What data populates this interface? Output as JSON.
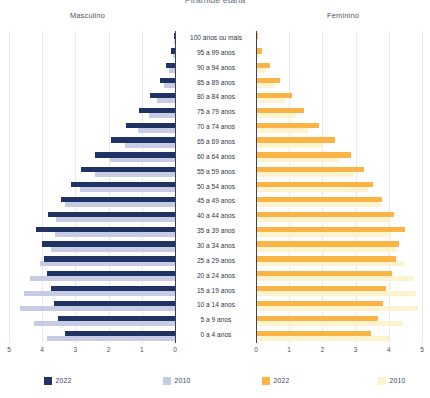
{
  "title": "Pirâmide etária",
  "headers": {
    "left": "Masculino",
    "right": "Feminino"
  },
  "axis": {
    "left_ticks": [
      "5",
      "4",
      "3",
      "2",
      "1",
      "0"
    ],
    "right_ticks": [
      "0",
      "1",
      "2",
      "3",
      "4",
      "5"
    ],
    "max": 5,
    "min": 0
  },
  "legend": [
    {
      "label": "2022",
      "color": "#1f3365",
      "side": "masculino",
      "series": "2022"
    },
    {
      "label": "2010",
      "color": "#c7cce4",
      "side": "masculino",
      "series": "2010"
    },
    {
      "label": "2022",
      "color": "#f9b445",
      "side": "feminino",
      "series": "2022"
    },
    {
      "label": "2010",
      "color": "#fdf3cf",
      "side": "feminino",
      "series": "2010"
    }
  ],
  "colors": {
    "male_2022": "#1f3365",
    "male_2010": "#c7cce4",
    "female_2022": "#f9b445",
    "female_2010": "#fdf3cf",
    "gridline": "#e9e9ec",
    "axis": "#3c4257",
    "text": "#3c4257",
    "background": "#ffffff"
  },
  "chart_data": {
    "type": "bar",
    "subtype": "population-pyramid",
    "title": "Pirâmide etária",
    "xlabel": "",
    "ylabel": "",
    "xlim": [
      0,
      5
    ],
    "grid": true,
    "legend_position": "bottom",
    "categories": [
      "100 anos ou mais",
      "95 a 99 anos",
      "90 a 94 anos",
      "85 a 89 anos",
      "80 a 84 anos",
      "75 a 79 anos",
      "70 a 74 anos",
      "65 a 69 anos",
      "60 a 64 anos",
      "55 a 59 anos",
      "50 a 54 anos",
      "45 a 49 anos",
      "40 a 44 anos",
      "35 a 39 anos",
      "30 a 34 anos",
      "25 a 29 anos",
      "20 a 24 anos",
      "15 a 19 anos",
      "10 a 14 anos",
      "5 a  9 anos",
      "0 a  4 anos"
    ],
    "series": [
      {
        "name": "2022",
        "side": "masculino",
        "color": "#1f3365",
        "values": [
          0.03,
          0.11,
          0.26,
          0.46,
          0.74,
          1.08,
          1.47,
          1.93,
          2.4,
          2.83,
          3.12,
          3.43,
          3.83,
          4.2,
          4.02,
          3.95,
          3.86,
          3.73,
          3.66,
          3.52,
          3.32
        ]
      },
      {
        "name": "2010",
        "side": "masculino",
        "color": "#c7cce4",
        "values": [
          0.02,
          0.07,
          0.17,
          0.32,
          0.55,
          0.79,
          1.12,
          1.52,
          1.96,
          2.42,
          2.87,
          3.3,
          3.57,
          3.62,
          3.74,
          4.06,
          4.37,
          4.54,
          4.66,
          4.26,
          3.85
        ]
      },
      {
        "name": "2022",
        "side": "feminino",
        "color": "#f9b445",
        "values": [
          0.07,
          0.19,
          0.42,
          0.71,
          1.07,
          1.46,
          1.9,
          2.38,
          2.86,
          3.25,
          3.52,
          3.8,
          4.15,
          4.48,
          4.31,
          4.22,
          4.1,
          3.91,
          3.82,
          3.66,
          3.45
        ]
      },
      {
        "name": "2010",
        "side": "feminino",
        "color": "#fdf3cf",
        "values": [
          0.05,
          0.13,
          0.31,
          0.56,
          0.88,
          1.2,
          1.58,
          2.03,
          2.5,
          2.96,
          3.38,
          3.76,
          4.01,
          4.06,
          4.21,
          4.47,
          4.72,
          4.82,
          4.88,
          4.44,
          4.01
        ]
      }
    ]
  }
}
